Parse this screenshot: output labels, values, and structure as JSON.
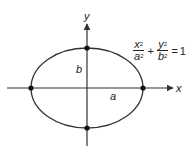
{
  "diagram": {
    "type": "ellipse-on-axes",
    "axes": {
      "x_label": "x",
      "y_label": "y"
    },
    "segment_labels": {
      "semi_major": "a",
      "semi_minor": "b"
    },
    "equation": {
      "term1_num": "x",
      "term1_den": "a",
      "term2_num": "y",
      "term2_den": "b",
      "exponent": "2",
      "plus": "+",
      "equals": "=",
      "rhs": "1"
    },
    "vertices": [
      "(-a,0)",
      "(a,0)",
      "(0,b)",
      "(0,-b)"
    ],
    "colors": {
      "stroke": "#333333",
      "background": "#ffffff"
    }
  }
}
